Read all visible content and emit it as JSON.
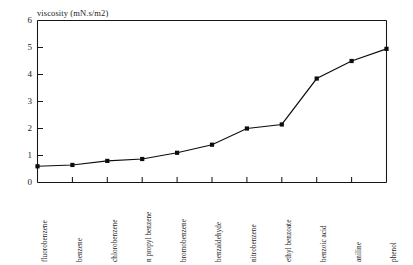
{
  "chart_data": {
    "type": "line",
    "title": "viscosity (mN.s/m2)",
    "xlabel": "",
    "ylabel": "viscosity (mN.s/m2)",
    "ylim": [
      0,
      6
    ],
    "yticks": [
      0,
      1,
      2,
      3,
      4,
      5,
      6
    ],
    "ytick_labels": [
      "0",
      "1",
      "2",
      "3",
      "4",
      "5",
      "6"
    ],
    "grid": false,
    "legend": "none",
    "marker": "square",
    "categories": [
      "fluorobenzene",
      "benzene",
      "chlorobenzene",
      "n propyl benzene",
      "bromobenzene",
      "benzaldehyde",
      "nitrobenzene",
      "ethyl benzoate",
      "benzoic acid",
      "aniline",
      "phenol"
    ],
    "values": [
      0.6,
      0.65,
      0.8,
      0.87,
      1.1,
      1.4,
      2.0,
      2.15,
      3.85,
      4.5,
      4.95
    ]
  },
  "colors": {
    "line": "#0d0d0d",
    "marker": "#0d0d0d",
    "axis": "#151515",
    "text": "#1c1c1c",
    "background": "#ffffff"
  }
}
